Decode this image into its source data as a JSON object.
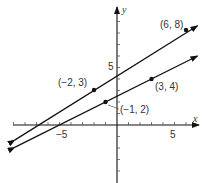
{
  "diagram": {
    "type": "coordinate-plane",
    "axes": {
      "x_label": "x",
      "y_label": "y",
      "x_tick_label": "5",
      "x_neg_tick_label": "−5",
      "y_tick_label": "5",
      "x_range": [
        -9,
        7
      ],
      "y_range": [
        -5,
        10
      ]
    },
    "lines": [
      {
        "name": "upper-line",
        "through": [
          [
            -2,
            3
          ],
          [
            6,
            8
          ]
        ],
        "slope": 0.625,
        "arrows": "both"
      },
      {
        "name": "lower-line",
        "through": [
          [
            -1,
            2
          ],
          [
            3,
            4
          ]
        ],
        "slope": 0.5,
        "arrows": "both"
      }
    ],
    "points": [
      {
        "x": 6,
        "y": 8,
        "label": "(6, 8)"
      },
      {
        "x": -2,
        "y": 3,
        "label": "(−2, 3)"
      },
      {
        "x": 3,
        "y": 4,
        "label": "(3, 4)"
      },
      {
        "x": -1,
        "y": 2,
        "label": "(−1, 2)"
      }
    ],
    "colors": {
      "ink": "#111111",
      "text": "#333333",
      "background": "#ffffff"
    }
  }
}
